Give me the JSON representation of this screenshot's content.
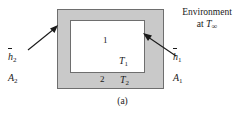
{
  "figure": {
    "caption": "(a)",
    "environment": {
      "line1": "Environment",
      "line2_prefix": "at ",
      "line2_symbol": "T",
      "line2_subscript": "∞"
    },
    "slab": {
      "outer_fill_color": "#c9c9c9",
      "inner_fill_color": "#ffffff",
      "outline_color": "#6e6e6e"
    },
    "labels": {
      "region_1": "1",
      "region_2": "2",
      "temperature_inner": {
        "symbol": "T",
        "subscript": "1"
      },
      "temperature_outer": {
        "symbol": "T",
        "subscript": "2"
      },
      "coefficient_inner": {
        "symbol": "h",
        "subscript": "1",
        "overbar": true
      },
      "area_inner": {
        "symbol": "A",
        "subscript": "1"
      },
      "coefficient_outer": {
        "symbol": "h",
        "subscript": "2",
        "overbar": true
      },
      "area_outer": {
        "symbol": "A",
        "subscript": "2"
      }
    },
    "arrows": {
      "left_arrow_name": "arrow-to-outer-surface",
      "right_arrow_name": "arrow-to-inner-surface"
    }
  }
}
